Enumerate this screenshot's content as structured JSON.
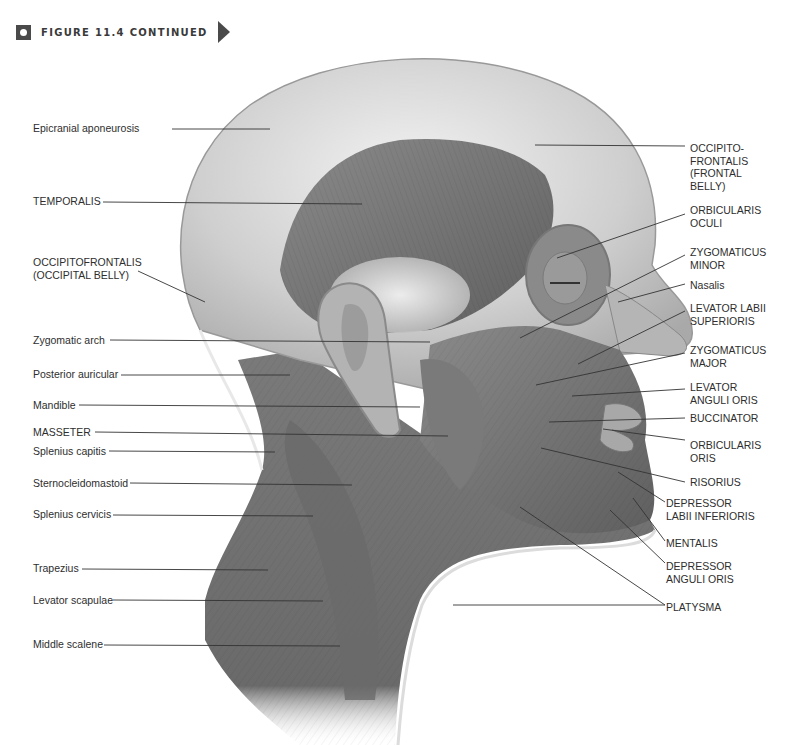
{
  "header": {
    "figure_title": "FIGURE 11.4 CONTINUED",
    "badge_icon": "figure-badge-icon",
    "arrow_icon": "continue-arrow-icon"
  },
  "figure": {
    "colors": {
      "background": "#ffffff",
      "muscle_dark": "#6e6e6e",
      "muscle_mid": "#9a9a9a",
      "aponeurosis": "#d8d8d8",
      "leader_line": "#333333",
      "label_text": "#2e2e2e"
    }
  },
  "labels_left": [
    {
      "text": "Epicranial aponeurosis",
      "x": 33,
      "y": 122,
      "line": [
        172,
        129,
        270,
        129
      ]
    },
    {
      "text": "TEMPORALIS",
      "x": 33,
      "y": 195,
      "line": [
        103,
        202,
        362,
        204
      ]
    },
    {
      "text": "OCCIPITOFRONTALIS\n(OCCIPITAL BELLY)",
      "x": 33,
      "y": 256,
      "line": [
        138,
        271,
        205,
        302
      ]
    },
    {
      "text": "Zygomatic arch",
      "x": 33,
      "y": 334,
      "line": [
        110,
        340,
        430,
        342
      ]
    },
    {
      "text": "Posterior auricular",
      "x": 33,
      "y": 368,
      "line": [
        121,
        375,
        290,
        375
      ]
    },
    {
      "text": "Mandible",
      "x": 33,
      "y": 399,
      "line": [
        79,
        405,
        420,
        407
      ]
    },
    {
      "text": "MASSETER",
      "x": 33,
      "y": 426,
      "line": [
        95,
        432,
        448,
        436
      ]
    },
    {
      "text": "Splenius capitis",
      "x": 33,
      "y": 445,
      "line": [
        109,
        451,
        275,
        452
      ]
    },
    {
      "text": "Sternocleidomastoid",
      "x": 33,
      "y": 477,
      "line": [
        130,
        483,
        352,
        485
      ]
    },
    {
      "text": "Splenius cervicis",
      "x": 33,
      "y": 508,
      "line": [
        113,
        515,
        313,
        516
      ]
    },
    {
      "text": "Trapezius",
      "x": 33,
      "y": 562,
      "line": [
        82,
        569,
        268,
        570
      ]
    },
    {
      "text": "Levator scapulae",
      "x": 33,
      "y": 594,
      "line": [
        113,
        600,
        323,
        601
      ]
    },
    {
      "text": "Middle scalene",
      "x": 33,
      "y": 638,
      "line": [
        104,
        645,
        340,
        646
      ]
    }
  ],
  "labels_right": [
    {
      "text": "OCCIPITO-\nFRONTALIS\n(FRONTAL\nBELLY)",
      "x": 690,
      "y": 142,
      "line": [
        535,
        145,
        685,
        146
      ]
    },
    {
      "text": "ORBICULARIS\nOCULI",
      "x": 690,
      "y": 204,
      "line": [
        557,
        258,
        685,
        214
      ]
    },
    {
      "text": "ZYGOMATICUS\nMINOR",
      "x": 690,
      "y": 246,
      "line": [
        520,
        338,
        685,
        255
      ]
    },
    {
      "text": "Nasalis",
      "x": 690,
      "y": 279,
      "line": [
        618,
        302,
        685,
        284
      ]
    },
    {
      "text": "LEVATOR LABII\nSUPERIORIS",
      "x": 690,
      "y": 302,
      "line": [
        578,
        364,
        685,
        311
      ]
    },
    {
      "text": "ZYGOMATICUS\nMAJOR",
      "x": 690,
      "y": 344,
      "line": [
        536,
        385,
        685,
        353
      ]
    },
    {
      "text": "LEVATOR\nANGULI ORIS",
      "x": 690,
      "y": 381,
      "line": [
        572,
        396,
        685,
        389
      ]
    },
    {
      "text": "BUCCINATOR",
      "x": 690,
      "y": 412,
      "line": [
        549,
        422,
        685,
        418
      ]
    },
    {
      "text": "ORBICULARIS\nORIS",
      "x": 690,
      "y": 439,
      "line": [
        603,
        429,
        685,
        440
      ]
    },
    {
      "text": "RISORIUS",
      "x": 690,
      "y": 476,
      "line": [
        541,
        448,
        685,
        482
      ]
    },
    {
      "text": "DEPRESSOR\nLABII INFERIORIS",
      "x": 666,
      "y": 497,
      "line": [
        618,
        472,
        665,
        502
      ]
    },
    {
      "text": "MENTALIS",
      "x": 666,
      "y": 537,
      "line": [
        633,
        498,
        665,
        541
      ]
    },
    {
      "text": "DEPRESSOR\nANGULI ORIS",
      "x": 666,
      "y": 560,
      "line": [
        610,
        510,
        665,
        563
      ]
    },
    {
      "text": "PLATYSMA",
      "x": 666,
      "y": 601,
      "line": [
        520,
        507,
        665,
        605
      ],
      "line2": [
        453,
        605,
        665,
        605
      ]
    }
  ]
}
